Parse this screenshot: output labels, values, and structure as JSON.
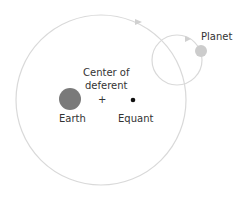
{
  "diagram": {
    "labels": {
      "planet": "Planet",
      "center_line1": "Center of",
      "center_line2": "deferent",
      "center_mark": "+",
      "earth": "Earth",
      "equant": "Equant"
    },
    "colors": {
      "deferent": "#d9d9d9",
      "epicycle": "#d9d9d9",
      "planet": "#cccccc",
      "earth": "#7a7a7a",
      "equant": "#111111",
      "text": "#333333"
    }
  }
}
